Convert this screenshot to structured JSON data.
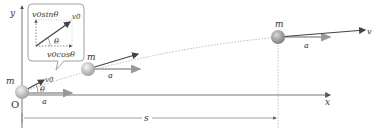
{
  "diagram": {
    "axes": {
      "x_label": "x",
      "y_label": "y",
      "origin_label": "O"
    },
    "mass_label": "m",
    "initial_velocity_label": "v0",
    "acceleration_label": "a",
    "angle_label": "θ",
    "final_velocity_label": "v",
    "distance_label": "s",
    "inset": {
      "vertical_component": "v0sinθ",
      "horizontal_component": "v0cosθ",
      "vector_label": "v0",
      "angle_label": "θ"
    },
    "colors": {
      "axis": "#555555",
      "velocity_arrow": "#444444",
      "acceleration_arrow": "#8a8a8a",
      "trajectory": "#aaaaaa",
      "ball": "#bbbbbb"
    }
  }
}
